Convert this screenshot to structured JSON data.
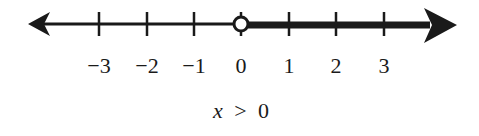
{
  "number_line": {
    "ticks": [
      {
        "value": -3,
        "label": "−3",
        "x": 99
      },
      {
        "value": -2,
        "label": "−2",
        "x": 147
      },
      {
        "value": -1,
        "label": "−1",
        "x": 194
      },
      {
        "value": 0,
        "label": "0",
        "x": 241
      },
      {
        "value": 1,
        "label": "1",
        "x": 289
      },
      {
        "value": 2,
        "label": "2",
        "x": 336
      },
      {
        "value": 3,
        "label": "3",
        "x": 384
      }
    ],
    "boundary_point": {
      "value": 0,
      "type": "open"
    },
    "shaded_direction": "right",
    "colors": {
      "line": "#1a1a1a",
      "background": "#ffffff"
    }
  },
  "caption": {
    "variable": "x",
    "operator": ">",
    "value": "0",
    "text": "x > 0"
  }
}
